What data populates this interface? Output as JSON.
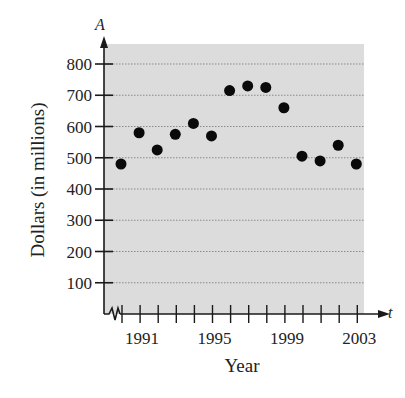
{
  "chart_data": {
    "type": "scatter",
    "title": "",
    "xlabel": "Year",
    "ylabel": "Dollars (in millions)",
    "x_axis_variable": "t",
    "y_axis_variable": "A",
    "x": [
      1990,
      1991,
      1992,
      1993,
      1994,
      1995,
      1996,
      1997,
      1998,
      1999,
      2000,
      2001,
      2002,
      2003
    ],
    "series": [
      {
        "name": "A",
        "values": [
          480,
          580,
          525,
          575,
          610,
          570,
          715,
          730,
          725,
          660,
          505,
          490,
          540,
          480
        ]
      }
    ],
    "xlim": [
      1990,
      2003
    ],
    "ylim": [
      0,
      850
    ],
    "x_ticks": [
      1990,
      1991,
      1992,
      1993,
      1994,
      1995,
      1996,
      1997,
      1998,
      1999,
      2000,
      2001,
      2002,
      2003
    ],
    "x_tick_labels": [
      "1991",
      "1995",
      "1999",
      "2003"
    ],
    "x_tick_label_values": [
      1991,
      1995,
      1999,
      2003
    ],
    "y_ticks": [
      100,
      200,
      300,
      400,
      500,
      600,
      700,
      800
    ],
    "y_tick_labels": [
      "100",
      "200",
      "300",
      "400",
      "500",
      "600",
      "700",
      "800"
    ],
    "x_axis_break": true,
    "grid": true,
    "grid_style": "dotted-horizontal",
    "legend": "none",
    "colors": {
      "plot_background": "#dcdcdc",
      "gridline": "#8a8a8a",
      "marker": "#0a0a0a",
      "axis": "#1a1a1a"
    }
  }
}
